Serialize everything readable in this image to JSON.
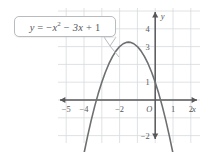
{
  "chart_data": {
    "type": "line",
    "title": "",
    "equation_label": "y = −x² − 3x + 1",
    "equation_parts": {
      "lhs": "y",
      "eq": "=",
      "term1_sign": "−",
      "term1_var": "x",
      "term1_exp": "2",
      "term2_sign": "−",
      "term2": "3x",
      "term3_sign": "+",
      "term3": "1"
    },
    "xlabel": "x",
    "ylabel": "y",
    "origin_label": "O",
    "xlim": [
      -5.45,
      2.55
    ],
    "ylim": [
      -2.75,
      4.85
    ],
    "grid": true,
    "grid_step": 1,
    "x_ticks": [
      -5,
      -4,
      -2,
      1,
      2
    ],
    "x_tick_labels": [
      "−5",
      "−4",
      "−2",
      "1",
      "2"
    ],
    "y_ticks": [
      4,
      3,
      1,
      -2
    ],
    "y_tick_labels": [
      "4",
      "3",
      "1",
      "−2"
    ],
    "function": "y = -x^2 - 3x + 1",
    "coefficients": {
      "a": -1,
      "b": -3,
      "c": 1
    },
    "vertex": [
      -1.5,
      3.25
    ],
    "y_intercept": 1,
    "x_intercepts": [
      -3.303,
      0.303
    ],
    "curve_points": [
      [
        -4.35,
        -4.97
      ],
      [
        -4.2,
        -4.04
      ],
      [
        -4.0,
        -3.0
      ],
      [
        -3.8,
        -2.04
      ],
      [
        -3.6,
        -1.16
      ],
      [
        -3.4,
        -0.36
      ],
      [
        -3.2,
        0.36
      ],
      [
        -3.0,
        1.0
      ],
      [
        -2.8,
        1.56
      ],
      [
        -2.6,
        2.04
      ],
      [
        -2.4,
        2.44
      ],
      [
        -2.2,
        2.76
      ],
      [
        -2.0,
        3.0
      ],
      [
        -1.8,
        3.16
      ],
      [
        -1.6,
        3.24
      ],
      [
        -1.5,
        3.25
      ],
      [
        -1.4,
        3.24
      ],
      [
        -1.2,
        3.16
      ],
      [
        -1.0,
        3.0
      ],
      [
        -0.8,
        2.76
      ],
      [
        -0.6,
        2.44
      ],
      [
        -0.4,
        2.04
      ],
      [
        -0.2,
        1.56
      ],
      [
        0.0,
        1.0
      ],
      [
        0.2,
        0.36
      ],
      [
        0.4,
        -0.36
      ],
      [
        0.6,
        -1.16
      ],
      [
        0.8,
        -2.04
      ],
      [
        1.0,
        -3.0
      ],
      [
        1.2,
        -4.04
      ],
      [
        1.35,
        -4.87
      ]
    ],
    "axis_arrows": [
      "left",
      "right",
      "up",
      "down"
    ],
    "curve_arrows": [
      "down-left",
      "down-right"
    ],
    "colors": {
      "curve": "#6d6f71",
      "axis": "#58585a",
      "grid": "#d7dadd",
      "text": "#55585a",
      "callout_border": "#b9bcbe",
      "background": "#ffffff"
    }
  }
}
